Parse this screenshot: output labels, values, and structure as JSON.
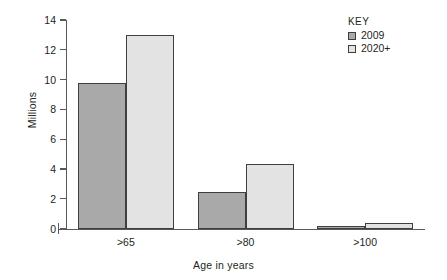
{
  "chart_data": {
    "type": "bar",
    "title": "",
    "subtitle": "",
    "xlabel": "Age in years",
    "ylabel": "Millions",
    "categories": [
      ">65",
      ">80",
      ">100"
    ],
    "series": [
      {
        "name": "2009",
        "color": "#a9a9a9",
        "values": [
          9.75,
          2.45,
          0.15
        ]
      },
      {
        "name": "2020+",
        "color": "#e3e3e3",
        "values": [
          13.0,
          4.35,
          0.4
        ]
      }
    ],
    "ylim": [
      0,
      14
    ],
    "yticks": [
      0,
      2,
      4,
      6,
      8,
      10,
      12,
      14
    ],
    "ytick_labels": [
      "0",
      "2",
      "4",
      "6",
      "8",
      "10",
      "12",
      "14"
    ],
    "grid": false,
    "legend": {
      "title": "KEY",
      "position": "top-right",
      "entries": [
        "2009",
        "2020+"
      ]
    },
    "axis_color": "#58595b",
    "bar_outline_color": "#3f3f3f",
    "background": "#ffffff"
  }
}
